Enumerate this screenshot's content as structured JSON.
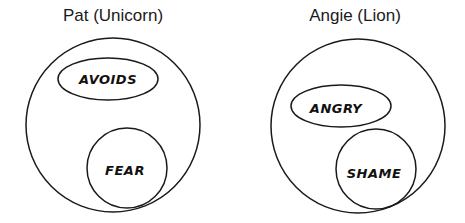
{
  "diagrams": [
    {
      "title": "Pat (Unicorn)",
      "outer_circle": {
        "cx": 113,
        "cy": 125,
        "r": 87
      },
      "ellipse": {
        "label": "AVOIDS",
        "cx": 108,
        "cy": 79,
        "rx": 50,
        "ry": 21
      },
      "inner_circle": {
        "label": "FEAR",
        "cx": 127,
        "cy": 168,
        "r": 40
      }
    },
    {
      "title": "Angie (Lion)",
      "outer_circle": {
        "cx": 358,
        "cy": 126,
        "r": 87
      },
      "ellipse": {
        "label": "ANGRY",
        "cx": 341,
        "cy": 106,
        "rx": 50,
        "ry": 21
      },
      "inner_circle": {
        "label": "SHAME",
        "cx": 376,
        "cy": 169,
        "r": 40
      }
    }
  ],
  "colors": {
    "stroke": "#1a1a1a",
    "background": "#ffffff"
  }
}
